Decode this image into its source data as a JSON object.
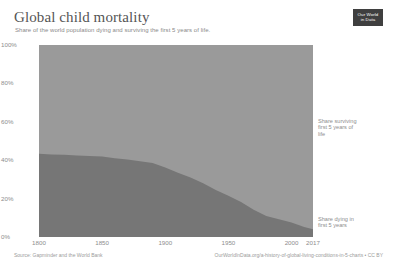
{
  "header": {
    "title": "Global child mortality",
    "subtitle": "Share of the world population dying and surviving the first 5 years of life.",
    "logo_line1": "Our World",
    "logo_line2": "in Data"
  },
  "footer": {
    "source": "Source: Gapminder and the World Bank",
    "link": "OurWorldInData.org/a-history-of-global-living-conditions-in-5-charts • CC BY"
  },
  "colors": {
    "surviving": "#9a9a9a",
    "dying": "#767676",
    "axis_text": "#8d8d8d",
    "title_text": "#555555",
    "logo_bg": "#3f3f3f"
  },
  "chart_data": {
    "type": "area",
    "stacked": true,
    "title": "Global child mortality",
    "subtitle": "Share of the world population dying and surviving the first 5 years of life.",
    "xlabel": "",
    "ylabel": "",
    "xlim": [
      1800,
      2017
    ],
    "ylim": [
      0,
      100
    ],
    "grid": false,
    "legend_position": "right-inline",
    "y_ticks": [
      "0%",
      "20%",
      "40%",
      "60%",
      "80%",
      "100%"
    ],
    "y_tick_values": [
      0,
      20,
      40,
      60,
      80,
      100
    ],
    "x_ticks": [
      "1800",
      "1850",
      "1900",
      "1950",
      "2000",
      "2017"
    ],
    "x_tick_values": [
      1800,
      1850,
      1900,
      1950,
      2000,
      2017
    ],
    "x": [
      1800,
      1810,
      1820,
      1830,
      1840,
      1850,
      1860,
      1870,
      1880,
      1890,
      1900,
      1910,
      1920,
      1930,
      1940,
      1950,
      1960,
      1970,
      1980,
      1990,
      2000,
      2010,
      2017
    ],
    "series": [
      {
        "name": "Share dying in first 5 years",
        "color": "#767676",
        "values": [
          43.3,
          43.0,
          42.8,
          42.5,
          42.2,
          41.9,
          41.0,
          40.3,
          39.5,
          38.6,
          36.2,
          33.5,
          31.0,
          28.0,
          24.5,
          21.5,
          18.2,
          14.2,
          11.0,
          9.3,
          7.6,
          5.2,
          4.1
        ]
      },
      {
        "name": "Share surviving first 5 years of life",
        "color": "#9a9a9a",
        "values": [
          56.7,
          57.0,
          57.2,
          57.5,
          57.8,
          58.1,
          59.0,
          59.7,
          60.5,
          61.4,
          63.8,
          66.5,
          69.0,
          72.0,
          75.5,
          78.5,
          81.8,
          85.8,
          89.0,
          90.7,
          92.4,
          94.8,
          95.9
        ]
      }
    ],
    "annotations": [
      {
        "name": "surviving-label",
        "text": "Share surviving\nfirst 5 years of\nlife"
      },
      {
        "name": "dying-label",
        "text": "Share dying in\nfirst 5 years"
      }
    ]
  }
}
